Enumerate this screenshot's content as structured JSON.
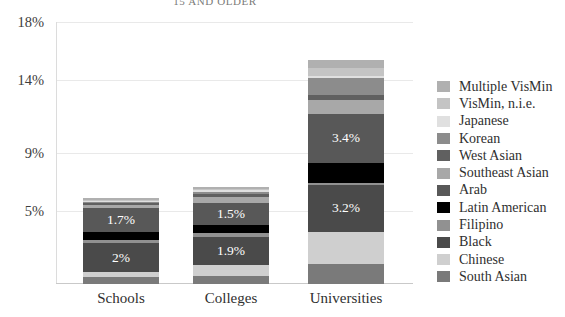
{
  "chart_data": {
    "type": "bar",
    "title": "15 AND OLDER",
    "xlabel": "",
    "ylabel": "",
    "stacked": true,
    "grid": true,
    "legend_position": "right",
    "ylim": [
      0,
      18
    ],
    "yticks": [
      "5%",
      "9%",
      "14%",
      "18%"
    ],
    "ytick_values": [
      5,
      9,
      14,
      18
    ],
    "categories": [
      "Schools",
      "Colleges",
      "Universities"
    ],
    "series": [
      {
        "name": "South Asian",
        "color": "#7a7a7a",
        "values": [
          0.45,
          0.55,
          1.35
        ],
        "labels": [
          "",
          "",
          ""
        ]
      },
      {
        "name": "Chinese",
        "color": "#cfcfcf",
        "values": [
          0.35,
          0.75,
          2.25
        ],
        "labels": [
          "",
          "",
          ""
        ]
      },
      {
        "name": "Black",
        "color": "#4a4a4a",
        "values": [
          2.0,
          1.9,
          3.2
        ],
        "labels": [
          "2%",
          "1.9%",
          "3.2%"
        ]
      },
      {
        "name": "Filipino",
        "color": "#919191",
        "values": [
          0.2,
          0.3,
          0.15
        ],
        "labels": [
          "",
          "",
          ""
        ]
      },
      {
        "name": "Latin American",
        "color": "#000000",
        "values": [
          0.55,
          0.55,
          1.35
        ],
        "labels": [
          "",
          "",
          ""
        ]
      },
      {
        "name": "Arab",
        "color": "#585858",
        "values": [
          1.7,
          1.5,
          3.4
        ],
        "labels": [
          "1.7%",
          "1.5%",
          "3.4%"
        ]
      },
      {
        "name": "Southeast Asian",
        "color": "#a8a8a8",
        "values": [
          0.2,
          0.45,
          0.95
        ],
        "labels": [
          "",
          "",
          ""
        ]
      },
      {
        "name": "West Asian",
        "color": "#606060",
        "values": [
          0.1,
          0.2,
          0.35
        ],
        "labels": [
          "",
          "",
          ""
        ]
      },
      {
        "name": "Korean",
        "color": "#8c8c8c",
        "values": [
          0.1,
          0.15,
          1.15
        ],
        "labels": [
          "",
          "",
          ""
        ]
      },
      {
        "name": "Japanese",
        "color": "#e0e0e0",
        "values": [
          0.05,
          0.1,
          0.15
        ],
        "labels": [
          "",
          "",
          ""
        ]
      },
      {
        "name": "VisMin, n.i.e.",
        "color": "#c4c4c4",
        "values": [
          0.1,
          0.1,
          0.55
        ],
        "labels": [
          "",
          "",
          ""
        ]
      },
      {
        "name": "Multiple VisMin",
        "color": "#b0b0b0",
        "values": [
          0.1,
          0.15,
          0.55
        ],
        "labels": [
          "",
          "",
          ""
        ]
      }
    ],
    "totals": [
      5.9,
      6.7,
      16.6
    ]
  },
  "legend": {
    "entries": [
      {
        "label": "Multiple VisMin",
        "color": "#b0b0b0"
      },
      {
        "label": "VisMin, n.i.e.",
        "color": "#c4c4c4"
      },
      {
        "label": "Japanese",
        "color": "#e0e0e0"
      },
      {
        "label": "Korean",
        "color": "#8c8c8c"
      },
      {
        "label": "West Asian",
        "color": "#606060"
      },
      {
        "label": "Southeast Asian",
        "color": "#a8a8a8"
      },
      {
        "label": "Arab",
        "color": "#585858"
      },
      {
        "label": "Latin American",
        "color": "#000000"
      },
      {
        "label": "Filipino",
        "color": "#919191"
      },
      {
        "label": "Black",
        "color": "#4a4a4a"
      },
      {
        "label": "Chinese",
        "color": "#cfcfcf"
      },
      {
        "label": "South Asian",
        "color": "#7a7a7a"
      }
    ]
  }
}
